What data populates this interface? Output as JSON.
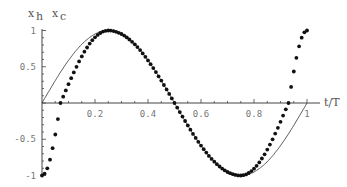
{
  "chart_data": {
    "type": "line",
    "title": "",
    "xlabel": "t/T",
    "ylabel_left": "x_h",
    "ylabel_right": "x_c",
    "xlim": [
      0,
      1
    ],
    "ylim": [
      -1,
      1
    ],
    "x_ticks": [
      "0.2",
      "0.4",
      "0.6",
      "0.8",
      "1"
    ],
    "y_ticks": [
      "1",
      "0.5",
      "-0.5",
      "-1"
    ],
    "grid": false,
    "series": [
      {
        "name": "x_h",
        "style": "solid line",
        "function": "sin(2*pi*t)",
        "x": [
          0,
          0.125,
          0.25,
          0.375,
          0.5,
          0.625,
          0.75,
          0.875,
          1
        ],
        "values": [
          0,
          0.71,
          1,
          0.71,
          0,
          -0.71,
          -1,
          -0.71,
          0
        ]
      },
      {
        "name": "x_c",
        "style": "dots",
        "x": [
          0,
          0.07,
          0.25,
          0.5,
          0.75,
          0.93,
          1
        ],
        "values": [
          -1,
          0,
          1,
          0,
          -1,
          0,
          1
        ]
      }
    ]
  },
  "labels": {
    "xh": "x",
    "xh_sub": "h",
    "xc": "x",
    "xc_sub": "c",
    "xaxis": "t/T"
  }
}
